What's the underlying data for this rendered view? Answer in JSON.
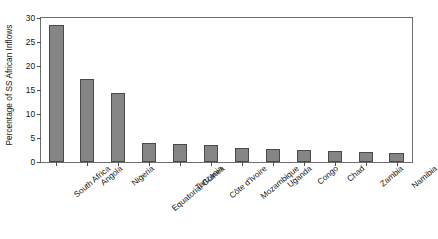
{
  "chart_data": {
    "type": "bar",
    "title": "",
    "xlabel": "",
    "ylabel": "Percentage of SS African Inflows",
    "ylim": [
      0,
      30
    ],
    "yticks": [
      0,
      5,
      10,
      15,
      20,
      25,
      30
    ],
    "grid": false,
    "legend": null,
    "bar_color": "#858585",
    "bar_edge_color": "#4a4a4a",
    "categories": [
      "South Africa",
      "Angola",
      "Nigeria",
      "Equatorial Guinea",
      "Tanzania",
      "Côte d'Ivoire",
      "Mozambique",
      "Uganda",
      "Congo",
      "Chad",
      "Zambia",
      "Namibia"
    ],
    "values": [
      28.5,
      17.2,
      14.3,
      3.9,
      3.7,
      3.5,
      3.0,
      2.8,
      2.4,
      2.3,
      2.1,
      1.9
    ]
  }
}
